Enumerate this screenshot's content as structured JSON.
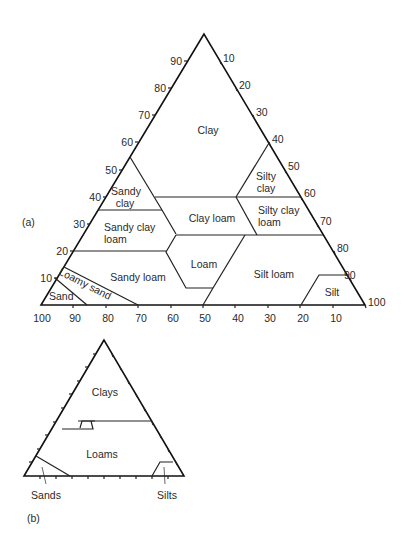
{
  "figure_a": {
    "label": "(a)",
    "left_axis_ticks": [
      "10",
      "20",
      "30",
      "40",
      "50",
      "60",
      "70",
      "80",
      "90"
    ],
    "right_axis_ticks": [
      "10",
      "20",
      "30",
      "40",
      "50",
      "60",
      "70",
      "80",
      "90",
      "100"
    ],
    "bottom_axis_ticks": [
      "100",
      "90",
      "80",
      "70",
      "60",
      "50",
      "40",
      "30",
      "20",
      "10"
    ],
    "regions": {
      "clay": "Clay",
      "silty_clay_1": "Silty",
      "silty_clay_2": "clay",
      "sandy_clay_1": "Sandy",
      "sandy_clay_2": "clay",
      "clay_loam": "Clay loam",
      "silty_clay_loam_1": "Silty clay",
      "silty_clay_loam_2": "loam",
      "sandy_clay_loam_1": "Sandy clay",
      "sandy_clay_loam_2": "loam",
      "loam": "Loam",
      "sandy_loam": "Sandy loam",
      "silt_loam": "Silt loam",
      "silt": "Silt",
      "loamy_sand": "Loamy sand",
      "sand": "Sand"
    }
  },
  "figure_b": {
    "label": "(b)",
    "regions": {
      "clays": "Clays",
      "loams": "Loams",
      "sands": "Sands",
      "silts": "Silts"
    }
  }
}
